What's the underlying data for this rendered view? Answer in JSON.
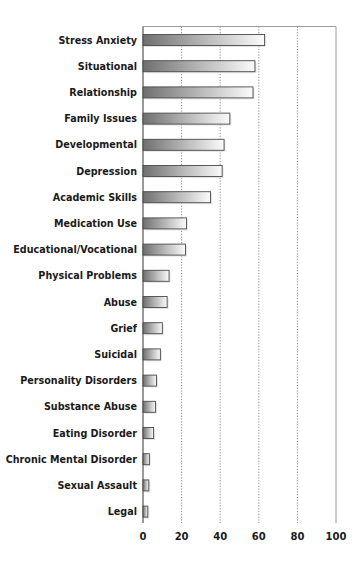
{
  "chart_data": {
    "type": "bar",
    "orientation": "horizontal",
    "title": "",
    "xlabel": "",
    "ylabel": "",
    "categories": [
      "Stress Anxiety",
      "Situational",
      "Relationship",
      "Family Issues",
      "Developmental",
      "Depression",
      "Academic Skills",
      "Medication Use",
      "Educational/Vocational",
      "Physical Problems",
      "Abuse",
      "Grief",
      "Suicidal",
      "Personality Disorders",
      "Substance Abuse",
      "Eating Disorder",
      "Chronic Mental Disorder",
      "Sexual Assault",
      "Legal"
    ],
    "values": [
      63,
      58,
      57,
      45,
      42,
      41,
      35,
      22.5,
      22,
      13.5,
      12.5,
      10,
      9,
      7,
      6.5,
      5.5,
      3.3,
      3,
      2.5
    ],
    "xlim": [
      0,
      100
    ],
    "xticks": [
      0,
      20,
      40,
      60,
      80,
      100
    ],
    "xtick_labels": [
      "0",
      "20",
      "40",
      "60",
      "80",
      "100"
    ],
    "grid": "vertical dotted",
    "legend": "none",
    "bar_style": "gray gradient (dark left to white right)"
  }
}
